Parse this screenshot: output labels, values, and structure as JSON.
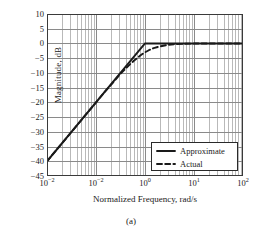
{
  "chart_data": {
    "type": "line",
    "title": "",
    "xlabel": "Normalized Frequency, rad/s",
    "ylabel": "Magnitude, dB",
    "caption": "(a)",
    "xscale": "log",
    "xlim": [
      0.01,
      100
    ],
    "ylim": [
      -45,
      10
    ],
    "yticks": [
      10,
      5,
      0,
      -5,
      -10,
      -15,
      -20,
      -25,
      -30,
      -35,
      -40,
      -45
    ],
    "ytick_labels": [
      "10",
      "5",
      "0",
      "-5",
      "-10",
      "-15",
      "-20",
      "-25",
      "-30",
      "-35",
      "-40",
      "-45"
    ],
    "xticks": [
      0.01,
      0.1,
      1,
      10,
      100
    ],
    "xtick_labels": [
      "10-2",
      "10-2",
      "10 0",
      "10 1",
      "10 2"
    ],
    "xtick_mantissa": [
      "10",
      "10",
      "10",
      "10",
      "10"
    ],
    "xtick_exponent": [
      "−2",
      "−2",
      "0",
      "1",
      "2"
    ],
    "grid": true,
    "grid_minor": true,
    "legend_position": "lower right",
    "series": [
      {
        "name": "Approximate",
        "style": "solid",
        "color": "#1a1a1a",
        "points": [
          [
            0.01,
            -40
          ],
          [
            1,
            0
          ],
          [
            100,
            0
          ]
        ]
      },
      {
        "name": "Actual",
        "style": "dashed",
        "color": "#1a1a1a",
        "points": [
          [
            0.01,
            -40.0
          ],
          [
            0.02,
            -34.0
          ],
          [
            0.04,
            -28.0
          ],
          [
            0.07,
            -23.1
          ],
          [
            0.1,
            -20.04
          ],
          [
            0.15,
            -16.5
          ],
          [
            0.2,
            -14.15
          ],
          [
            0.3,
            -10.7
          ],
          [
            0.4,
            -8.6
          ],
          [
            0.5,
            -6.99
          ],
          [
            0.6,
            -5.8
          ],
          [
            0.7,
            -4.9
          ],
          [
            0.8,
            -4.1
          ],
          [
            0.9,
            -3.5
          ],
          [
            1.0,
            -3.01
          ],
          [
            1.2,
            -2.3
          ],
          [
            1.5,
            -1.6
          ],
          [
            2.0,
            -1.0
          ],
          [
            3.0,
            -0.46
          ],
          [
            4.0,
            -0.26
          ],
          [
            6.0,
            -0.12
          ],
          [
            10.0,
            -0.04
          ],
          [
            20.0,
            -0.01
          ],
          [
            100.0,
            0.0
          ]
        ]
      }
    ]
  },
  "legend": {
    "items": [
      {
        "label": "Approximate",
        "style": "solid"
      },
      {
        "label": "Actual",
        "style": "dashed"
      }
    ]
  },
  "colors": {
    "curve": "#1a1a1a",
    "axis": "#3a3a3a",
    "grid_major": "#8a8a8a",
    "grid_minor": "#b9b9b9",
    "background": "#ffffff",
    "text": "#1a1a1a"
  }
}
